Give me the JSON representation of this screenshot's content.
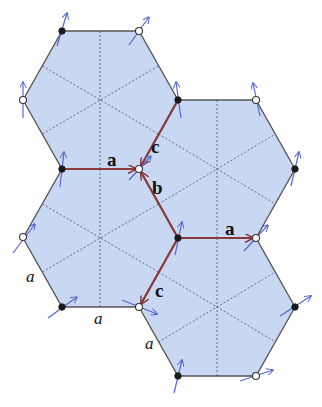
{
  "figure": {
    "colors": {
      "hex_fill": "#c9d8f2",
      "hex_edge": "#555555",
      "bond_vector": "#8a3a3a",
      "spin_arrow": "#5566cc",
      "sublattice_A": "#1a1a1a",
      "sublattice_B": "#ffffff"
    },
    "vector_labels": {
      "a_upper": "a",
      "a_lower": "a",
      "b": "b",
      "c_upper": "c",
      "c_lower": "c"
    },
    "length_labels": {
      "left_edge": "a",
      "bottom_edge": "a",
      "lower_right_edge": "a"
    },
    "hexagons": [
      "top-left",
      "right",
      "lower-left",
      "lower-right"
    ],
    "vertices": [
      {
        "id": "v1",
        "sublattice": "filled"
      },
      {
        "id": "v2",
        "sublattice": "open"
      },
      {
        "id": "v3",
        "sublattice": "open"
      },
      {
        "id": "v4",
        "sublattice": "filled"
      },
      {
        "id": "v5",
        "sublattice": "open"
      },
      {
        "id": "v6",
        "sublattice": "filled"
      },
      {
        "id": "v7",
        "sublattice": "open"
      },
      {
        "id": "v8",
        "sublattice": "filled"
      },
      {
        "id": "v9",
        "sublattice": "filled"
      },
      {
        "id": "v10",
        "sublattice": "open"
      },
      {
        "id": "v11",
        "sublattice": "open"
      },
      {
        "id": "v12",
        "sublattice": "filled"
      },
      {
        "id": "v13",
        "sublattice": "filled"
      },
      {
        "id": "v14",
        "sublattice": "open"
      },
      {
        "id": "v15",
        "sublattice": "filled"
      },
      {
        "id": "v16",
        "sublattice": "open"
      }
    ]
  }
}
